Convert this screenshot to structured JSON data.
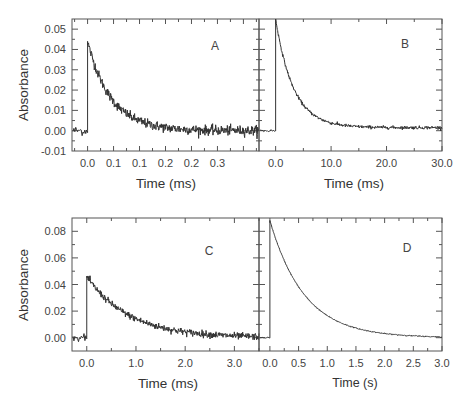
{
  "chart_data": [
    {
      "type": "line",
      "panel": "A",
      "xlabel": "Time (ms)",
      "ylabel": "Absorbance",
      "xlim": [
        -0.03,
        0.33
      ],
      "ylim": [
        -0.01,
        0.055
      ],
      "xticks": [
        0.0,
        0.05,
        0.1,
        0.15,
        0.2,
        0.25
      ],
      "xtick_labels": [
        "0.0",
        "0.1",
        "0.1",
        "0.2",
        "0.2",
        "0.3"
      ],
      "yticks": [
        -0.01,
        0.0,
        0.01,
        0.02,
        0.03,
        0.04,
        0.05
      ],
      "ytick_labels": [
        "-0.01",
        "0.00",
        "0.01",
        "0.02",
        "0.03",
        "0.04",
        "0.05"
      ],
      "baseline": 0.0,
      "jump_time": 0.0,
      "peak": 0.044,
      "decay_tau": 0.045,
      "offset": 0.0,
      "noise": 0.0012,
      "series": [
        {
          "name": "transient",
          "x": [
            -0.03,
            -0.001,
            0.0,
            0.005,
            0.02,
            0.05,
            0.08,
            0.1,
            0.15,
            0.2,
            0.25,
            0.33
          ],
          "y": [
            0.0,
            0.0,
            0.044,
            0.044,
            0.03,
            0.02,
            0.013,
            0.009,
            0.004,
            0.002,
            0.001,
            0.0
          ]
        }
      ]
    },
    {
      "type": "line",
      "panel": "B",
      "xlabel": "Time (ms)",
      "ylabel": "",
      "xlim": [
        -3.0,
        30.0
      ],
      "ylim": [
        -0.01,
        0.055
      ],
      "xticks": [
        0.0,
        10.0,
        20.0,
        30.0
      ],
      "xtick_labels": [
        "0.0",
        "10.0",
        "20.0",
        "30.0"
      ],
      "yticks": [
        -0.01,
        0.0,
        0.01,
        0.02,
        0.03,
        0.04,
        0.05
      ],
      "ytick_labels": [],
      "baseline": 0.0,
      "jump_time": 0.0,
      "peak": 0.055,
      "decay_tau": 3.2,
      "offset": 0.0015,
      "noise": 0.0004,
      "series": [
        {
          "name": "transient",
          "x": [
            -3.0,
            0.0,
            0.0,
            2.0,
            5.0,
            10.0,
            15.0,
            20.0,
            25.0,
            30.0
          ],
          "y": [
            0.0,
            0.0,
            0.055,
            0.033,
            0.014,
            0.006,
            0.004,
            0.003,
            0.002,
            0.0015
          ]
        }
      ]
    },
    {
      "type": "line",
      "panel": "C",
      "xlabel": "Time (ms)",
      "ylabel": "Absorbance",
      "xlim": [
        -0.3,
        3.5
      ],
      "ylim": [
        -0.01,
        0.09
      ],
      "xticks": [
        0.0,
        1.0,
        2.0,
        3.0
      ],
      "xtick_labels": [
        "0.0",
        "1.0",
        "2.0",
        "3.0"
      ],
      "yticks": [
        0.0,
        0.02,
        0.04,
        0.06,
        0.08
      ],
      "ytick_labels": [
        "0.00",
        "0.02",
        "0.04",
        "0.06",
        "0.08"
      ],
      "baseline": 0.0,
      "jump_time": 0.0,
      "peak": 0.046,
      "decay_tau": 0.85,
      "offset": 0.0,
      "noise": 0.0013,
      "series": [
        {
          "name": "transient",
          "x": [
            -0.3,
            0.0,
            0.0,
            0.5,
            1.0,
            1.5,
            2.0,
            2.5,
            3.0,
            3.5
          ],
          "y": [
            0.0,
            0.0,
            0.046,
            0.028,
            0.016,
            0.009,
            0.005,
            0.003,
            0.002,
            0.001
          ]
        }
      ]
    },
    {
      "type": "line",
      "panel": "D",
      "xlabel": "Time (s)",
      "ylabel": "",
      "xlim": [
        -0.19,
        3.0
      ],
      "ylim": [
        -0.01,
        0.09
      ],
      "xticks": [
        0.0,
        0.5,
        1.0,
        1.5,
        2.0,
        2.5,
        3.0
      ],
      "xtick_labels": [
        "0.0",
        "0.5",
        "1.0",
        "1.5",
        "2.0",
        "2.5",
        "3.0"
      ],
      "yticks": [
        0.0,
        0.02,
        0.04,
        0.06,
        0.08
      ],
      "ytick_labels": [],
      "baseline": 0.0,
      "jump_time": 0.0,
      "peak": 0.088,
      "decay_tau": 0.6,
      "offset": 0.0,
      "noise": 0.0002,
      "series": [
        {
          "name": "transient",
          "x": [
            -0.19,
            0.0,
            0.0,
            0.5,
            1.0,
            1.5,
            2.0,
            2.5,
            3.0
          ],
          "y": [
            0.0,
            0.0,
            0.088,
            0.055,
            0.037,
            0.027,
            0.019,
            0.014,
            0.01
          ]
        }
      ]
    }
  ],
  "figure": {
    "panel_labels": [
      "A",
      "B",
      "C",
      "D"
    ],
    "y_axis_title": "Absorbance",
    "top_row_x_title_left": "Time (ms)",
    "top_row_x_title_right": "Time (ms)",
    "bottom_row_x_title_left": "Time (ms)",
    "bottom_row_x_title_right": "Time (s)"
  }
}
